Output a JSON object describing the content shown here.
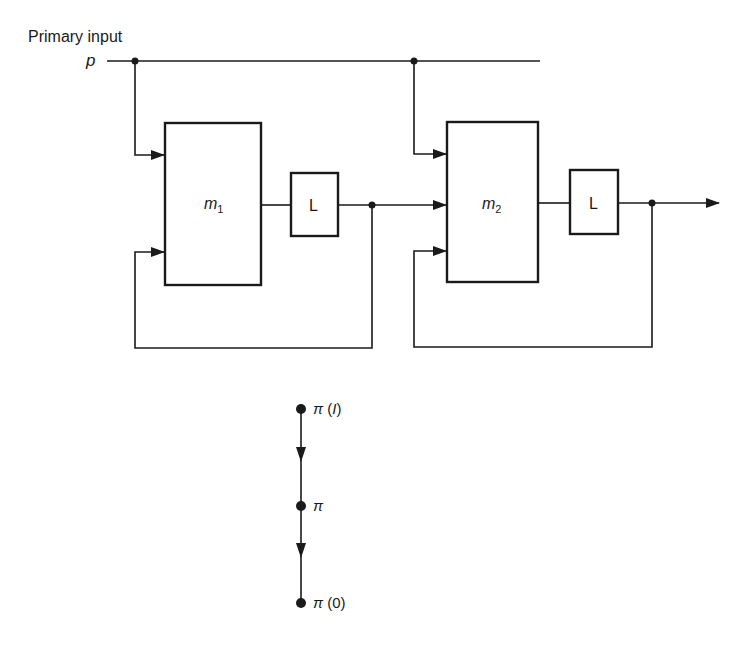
{
  "diagram": {
    "input_label": "Primary input",
    "input_symbol": "p",
    "machines": [
      {
        "name": "m",
        "subscript": "1"
      },
      {
        "name": "m",
        "subscript": "2"
      }
    ],
    "latches": [
      {
        "label": "L"
      },
      {
        "label": "L"
      }
    ],
    "chain": {
      "nodes": [
        {
          "symbol": "π",
          "suffix": " (",
          "arg": "I",
          "close": ")"
        },
        {
          "symbol": "π",
          "suffix": "",
          "arg": "",
          "close": ""
        },
        {
          "symbol": "π",
          "suffix": " (",
          "arg": "0",
          "close": ")"
        }
      ]
    },
    "colors": {
      "line": "#1a1a1a",
      "background": "#ffffff"
    }
  }
}
